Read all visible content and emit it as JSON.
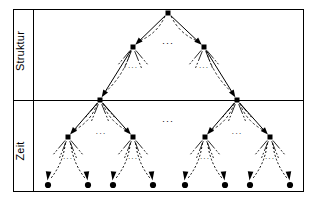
{
  "figure": {
    "kind": "tree-diagram",
    "background": "#ffffff",
    "stroke_color": "#000000",
    "node_color": "#000000",
    "width": 316,
    "height": 200
  },
  "frame": {
    "outer": {
      "x": 13,
      "y": 9,
      "w": 290,
      "h": 182
    },
    "label_column_divider_x": 33,
    "section_divider_y": 100
  },
  "labels": {
    "struktur": "Struktur",
    "zeit": "Zeit",
    "struktur_name": "section-label-struktur",
    "zeit_name": "section-label-zeit"
  },
  "ellipses": {
    "glyph": "···",
    "positions": [
      {
        "x": 168,
        "y": 46,
        "size": 9,
        "name": "ellipsis-level2-middle"
      },
      {
        "x": 133,
        "y": 70,
        "size": 7,
        "name": "ellipsis-under-left-l2"
      },
      {
        "x": 204,
        "y": 70,
        "size": 7,
        "name": "ellipsis-under-right-l2"
      },
      {
        "x": 168,
        "y": 124,
        "size": 9,
        "name": "ellipsis-level3-middle"
      },
      {
        "x": 101,
        "y": 136,
        "size": 8,
        "name": "ellipsis-left-l4-pair"
      },
      {
        "x": 237,
        "y": 136,
        "size": 8,
        "name": "ellipsis-right-l4-pair"
      },
      {
        "x": 68,
        "y": 161,
        "size": 7,
        "name": "ellipsis-under-l4-a"
      },
      {
        "x": 133,
        "y": 161,
        "size": 7,
        "name": "ellipsis-under-l4-b"
      },
      {
        "x": 205,
        "y": 161,
        "size": 7,
        "name": "ellipsis-under-l4-c"
      },
      {
        "x": 270,
        "y": 161,
        "size": 7,
        "name": "ellipsis-under-l4-d"
      }
    ]
  },
  "tree": {
    "node_size": 5,
    "levels": [
      {
        "level": 1,
        "name": "root-level",
        "nodes": [
          {
            "id": "n0",
            "x": 168,
            "y": 13,
            "name": "tree-node-root"
          }
        ]
      },
      {
        "level": 2,
        "name": "level-2",
        "nodes": [
          {
            "id": "n1",
            "x": 133,
            "y": 47,
            "name": "tree-node-l2-left"
          },
          {
            "id": "n2",
            "x": 204,
            "y": 47,
            "name": "tree-node-l2-right"
          }
        ]
      },
      {
        "level": 3,
        "name": "level-3",
        "nodes": [
          {
            "id": "n3",
            "x": 100,
            "y": 100,
            "name": "tree-node-l3-left"
          },
          {
            "id": "n4",
            "x": 237,
            "y": 100,
            "name": "tree-node-l3-right"
          }
        ]
      },
      {
        "level": 4,
        "name": "level-4",
        "nodes": [
          {
            "id": "n5",
            "x": 68,
            "y": 137,
            "name": "tree-node-l4-a"
          },
          {
            "id": "n6",
            "x": 133,
            "y": 137,
            "name": "tree-node-l4-b"
          },
          {
            "id": "n7",
            "x": 205,
            "y": 137,
            "name": "tree-node-l4-c"
          },
          {
            "id": "n8",
            "x": 270,
            "y": 137,
            "name": "tree-node-l4-d"
          }
        ]
      },
      {
        "level": 5,
        "name": "leaf-level",
        "nodes": [
          {
            "id": "l1",
            "x": 48,
            "y": 185,
            "name": "tree-leaf-1"
          },
          {
            "id": "l2",
            "x": 88,
            "y": 185,
            "name": "tree-leaf-2"
          },
          {
            "id": "l3",
            "x": 113,
            "y": 185,
            "name": "tree-leaf-3"
          },
          {
            "id": "l4",
            "x": 153,
            "y": 185,
            "name": "tree-leaf-4"
          },
          {
            "id": "l5",
            "x": 185,
            "y": 185,
            "name": "tree-leaf-5"
          },
          {
            "id": "l6",
            "x": 225,
            "y": 185,
            "name": "tree-leaf-6"
          },
          {
            "id": "l7",
            "x": 250,
            "y": 185,
            "name": "tree-leaf-7"
          },
          {
            "id": "l8",
            "x": 290,
            "y": 185,
            "name": "tree-leaf-8"
          }
        ]
      }
    ],
    "edges": [
      {
        "from": "n0",
        "to": "n1",
        "name": "edge-root-to-l2-left"
      },
      {
        "from": "n0",
        "to": "n2",
        "name": "edge-root-to-l2-right"
      },
      {
        "from": "n1",
        "to": "n3",
        "name": "edge-l2left-to-l3left"
      },
      {
        "from": "n2",
        "to": "n4",
        "name": "edge-l2right-to-l3right"
      },
      {
        "from": "n3",
        "to": "n5",
        "name": "edge-l3left-to-l4a"
      },
      {
        "from": "n3",
        "to": "n6",
        "name": "edge-l3left-to-l4b"
      },
      {
        "from": "n4",
        "to": "n7",
        "name": "edge-l3right-to-l4c"
      },
      {
        "from": "n4",
        "to": "n8",
        "name": "edge-l3right-to-l4d"
      }
    ],
    "leaf_edges": [
      {
        "from": "n5",
        "to": "l1",
        "name": "leaf-edge-1"
      },
      {
        "from": "n5",
        "to": "l2",
        "name": "leaf-edge-2"
      },
      {
        "from": "n6",
        "to": "l3",
        "name": "leaf-edge-3"
      },
      {
        "from": "n6",
        "to": "l4",
        "name": "leaf-edge-4"
      },
      {
        "from": "n7",
        "to": "l5",
        "name": "leaf-edge-5"
      },
      {
        "from": "n7",
        "to": "l6",
        "name": "leaf-edge-6"
      },
      {
        "from": "n8",
        "to": "l7",
        "name": "leaf-edge-7"
      },
      {
        "from": "n8",
        "to": "l8",
        "name": "leaf-edge-8"
      }
    ],
    "fans": [
      {
        "at": "n1",
        "name": "fan-l2-left"
      },
      {
        "at": "n2",
        "name": "fan-l2-right"
      },
      {
        "at": "n3",
        "name": "fan-l3-left"
      },
      {
        "at": "n4",
        "name": "fan-l3-right"
      },
      {
        "at": "n5",
        "name": "fan-l4-a"
      },
      {
        "at": "n6",
        "name": "fan-l4-b"
      },
      {
        "at": "n7",
        "name": "fan-l4-c"
      },
      {
        "at": "n8",
        "name": "fan-l4-d"
      }
    ]
  }
}
